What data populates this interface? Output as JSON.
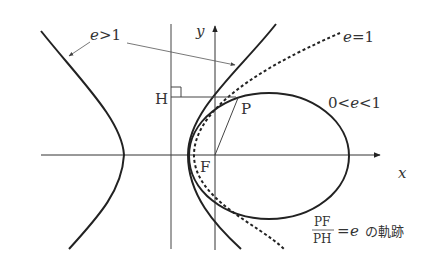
{
  "diagram": {
    "axes": {
      "x_label": "x",
      "y_label": "y"
    },
    "points": {
      "focus": "F",
      "foot_on_directrix": "H",
      "point_on_curve": "P"
    },
    "curve_labels": {
      "hyperbola": "e>1",
      "parabola": "e=1",
      "ellipse": "0<e<1"
    },
    "curve_labels_parts": {
      "hyperbola": {
        "var": "e",
        "rel": ">",
        "val": "1"
      },
      "parabola": {
        "var": "e",
        "rel": "=",
        "val": "1"
      },
      "ellipse": {
        "lo": "0",
        "rel1": "<",
        "var": "e",
        "rel2": "<",
        "val": "1"
      }
    },
    "caption": {
      "numerator": "PF",
      "denominator": "PH",
      "equals": "=",
      "var": "e",
      "suffix": "の軌跡"
    },
    "colors": {
      "stroke": "#222222",
      "thin_line": "#444444",
      "text": "#333333",
      "background": "#ffffff"
    }
  }
}
